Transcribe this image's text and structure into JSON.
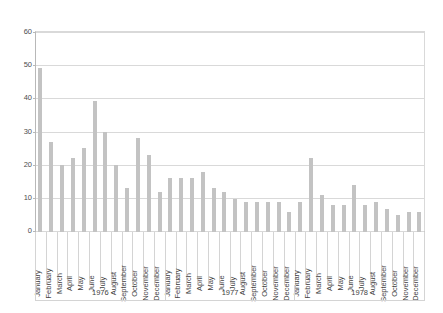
{
  "chart_data": {
    "type": "bar",
    "title": "",
    "subtitle": "",
    "xlabel": "",
    "ylabel": "",
    "ylim": [
      0,
      60
    ],
    "ytick_labels": [
      "0",
      "10",
      "20",
      "30",
      "40",
      "50",
      "60"
    ],
    "ytick_values": [
      0,
      10,
      20,
      30,
      40,
      50,
      60
    ],
    "grid": true,
    "legend": null,
    "bar_color": "#c3c3c3",
    "categories": [
      "January",
      "February",
      "March",
      "April",
      "May",
      "June",
      "July",
      "August",
      "September",
      "October",
      "November",
      "December",
      "January",
      "February",
      "March",
      "April",
      "May",
      "June",
      "July",
      "August",
      "September",
      "October",
      "November",
      "December",
      "January",
      "February",
      "March",
      "April",
      "May",
      "June",
      "July",
      "August",
      "September",
      "October",
      "November",
      "December"
    ],
    "values": [
      49,
      27,
      20,
      22,
      25,
      39,
      30,
      20,
      13,
      28,
      23,
      12,
      16,
      16,
      16,
      18,
      13,
      12,
      10,
      9,
      9,
      9,
      9,
      6,
      9,
      22,
      11,
      8,
      8,
      14,
      8,
      9,
      7,
      5,
      6,
      6
    ],
    "groups": [
      {
        "label": "1976",
        "count": 12
      },
      {
        "label": "1977",
        "count": 12
      },
      {
        "label": "1978",
        "count": 12
      }
    ]
  }
}
